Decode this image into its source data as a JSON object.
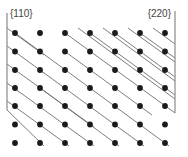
{
  "labels": {
    "left": "{110}",
    "right": "{220}"
  },
  "colors": {
    "background": "#ffffff",
    "atom": "#1a1a1a",
    "plane_line": "#6e6e6e",
    "bracket": "#8a8a8a",
    "label": "#444444"
  },
  "lattice": {
    "columns_x": [
      15,
      40,
      65,
      90,
      115,
      140,
      165
    ],
    "rows_y": [
      33,
      51.5,
      70,
      88,
      106,
      124.5,
      143
    ],
    "atom_radius": 2.9
  },
  "left_bracket": {
    "x": 7,
    "y_top": 13,
    "y_bottom": 110
  },
  "right_bracket": {
    "x": 175,
    "y_top": 11,
    "y_bottom": 113
  },
  "left_planes": [
    {
      "x1": 7,
      "y1": 28,
      "x2": 44,
      "y2": 55
    },
    {
      "x1": 7,
      "y1": 46,
      "x2": 44,
      "y2": 73
    },
    {
      "x1": 7,
      "y1": 64,
      "x2": 94,
      "y2": 127
    },
    {
      "x1": 7,
      "y1": 83,
      "x2": 94,
      "y2": 146
    },
    {
      "x1": 7,
      "y1": 101,
      "x2": 69,
      "y2": 146
    },
    {
      "x1": 7,
      "y1": 110,
      "x2": 44,
      "y2": 146
    },
    {
      "x1": 15,
      "y1": 33,
      "x2": 169,
      "y2": 146
    },
    {
      "x1": 40,
      "y1": 70,
      "x2": 144,
      "y2": 146
    },
    {
      "x1": 40,
      "y1": 88,
      "x2": 119,
      "y2": 146
    }
  ],
  "right_planes": [
    {
      "x1": 78,
      "y1": 28,
      "x2": 175,
      "y2": 99
    },
    {
      "x1": 90,
      "y1": 33,
      "x2": 175,
      "y2": 95
    },
    {
      "x1": 103,
      "y1": 28,
      "x2": 175,
      "y2": 81
    },
    {
      "x1": 115,
      "y1": 33,
      "x2": 175,
      "y2": 77
    },
    {
      "x1": 128,
      "y1": 28,
      "x2": 175,
      "y2": 62
    },
    {
      "x1": 140,
      "y1": 33,
      "x2": 175,
      "y2": 58
    },
    {
      "x1": 153,
      "y1": 28,
      "x2": 175,
      "y2": 44
    },
    {
      "x1": 65,
      "y1": 33,
      "x2": 175,
      "y2": 113
    },
    {
      "x1": 65,
      "y1": 51.5,
      "x2": 152,
      "y2": 115
    }
  ]
}
